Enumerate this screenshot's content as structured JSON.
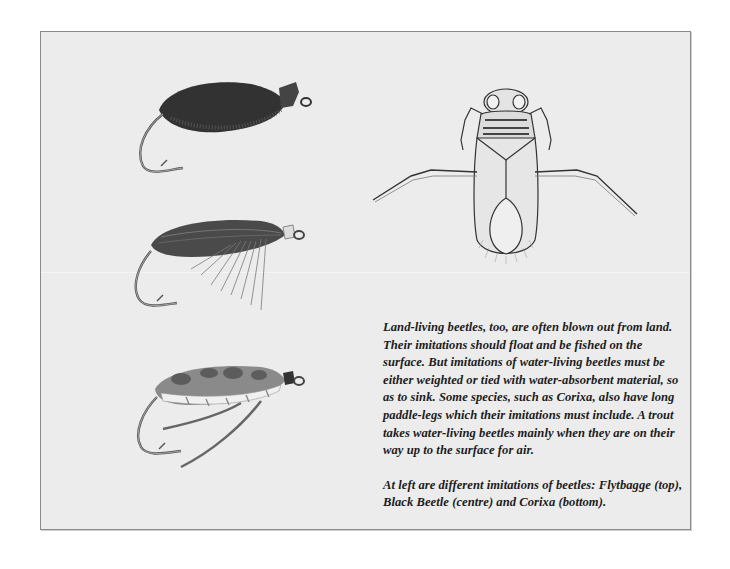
{
  "page": {
    "illustrations": [
      {
        "name": "Flytbagge",
        "position": "top",
        "description": "dark hackled beetle fly on hook"
      },
      {
        "name": "Black Beetle",
        "position": "centre",
        "description": "dark shell-backed fly with hackle fibres"
      },
      {
        "name": "Corixa",
        "position": "bottom",
        "description": "mottled back, silver-ribbed body, long paddle legs"
      },
      {
        "name": "Corixa (insect)",
        "position": "right",
        "description": "water boatman insect drawing, top view"
      }
    ],
    "text": {
      "paragraph1": "Land-living beetles, too, are often blown out from land. Their imitations should float and be fished on the surface. But imitations of water-living beetles must be either weighted or tied with water-absorbent material, so as to sink. Some species, such as  Corixa, also have long paddle-legs which their imitations must include. A trout takes water-living beetles mainly when they are on their way up to the surface for air.",
      "paragraph2": "At left are different imitations of beetles: Flytbagge  (top), Black Beetle  (centre)  and Corixa  (bottom)."
    },
    "colors": {
      "page_bg": "#ffffff",
      "frame_bg": "#ececec",
      "frame_border": "#8a8a8a",
      "text": "#1c1c1c"
    }
  }
}
